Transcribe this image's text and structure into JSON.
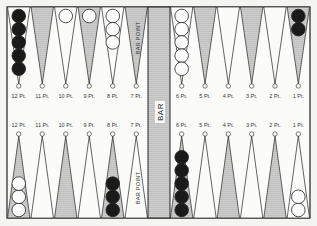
{
  "board": {
    "bar_label": "BAR",
    "bar_point_label": "BAR POINT",
    "top_labels": [
      "12 Pt.",
      "11 Pt.",
      "10 Pt.",
      "9 Pt.",
      "8 Pt.",
      "7 Pt.",
      "6 Pt.",
      "5 Pt.",
      "4 Pt.",
      "3 Pt.",
      "2 Pt.",
      "1 Pt."
    ],
    "bottom_labels": [
      "12 Pt.",
      "11 Pt.",
      "10 Pt.",
      "9 Pt.",
      "8 Pt.",
      "7 Pt.",
      "6 Pt.",
      "5 Pt.",
      "4 Pt.",
      "3 Pt.",
      "2 Pt.",
      "1 Pt."
    ],
    "colors": {
      "background": "#f4f4f2",
      "line": "#222222",
      "black_checker": "#1a1a1a",
      "white_checker": "#ffffff"
    },
    "top_points": [
      {
        "label": "12 Pt.",
        "shaded": false,
        "checkers": {
          "color": "black",
          "count": 5
        }
      },
      {
        "label": "11 Pt.",
        "shaded": true,
        "checkers": {
          "color": "none",
          "count": 0
        }
      },
      {
        "label": "10 Pt.",
        "shaded": false,
        "checkers": {
          "color": "white",
          "count": 1
        }
      },
      {
        "label": "9 Pt.",
        "shaded": true,
        "checkers": {
          "color": "white",
          "count": 1
        }
      },
      {
        "label": "8 Pt.",
        "shaded": false,
        "checkers": {
          "color": "white",
          "count": 3
        }
      },
      {
        "label": "7 Pt.",
        "shaded": true,
        "checkers": {
          "color": "none",
          "count": 0
        }
      },
      {
        "label": "6 Pt.",
        "shaded": false,
        "checkers": {
          "color": "white",
          "count": 5
        }
      },
      {
        "label": "5 Pt.",
        "shaded": true,
        "checkers": {
          "color": "none",
          "count": 0
        }
      },
      {
        "label": "4 Pt.",
        "shaded": false,
        "checkers": {
          "color": "none",
          "count": 0
        }
      },
      {
        "label": "3 Pt.",
        "shaded": true,
        "checkers": {
          "color": "none",
          "count": 0
        }
      },
      {
        "label": "2 Pt.",
        "shaded": false,
        "checkers": {
          "color": "none",
          "count": 0
        }
      },
      {
        "label": "1 Pt.",
        "shaded": true,
        "checkers": {
          "color": "black",
          "count": 2
        }
      }
    ],
    "bottom_points": [
      {
        "label": "12 Pt.",
        "shaded": true,
        "checkers": {
          "color": "white",
          "count": 3
        }
      },
      {
        "label": "11 Pt.",
        "shaded": false,
        "checkers": {
          "color": "none",
          "count": 0
        }
      },
      {
        "label": "10 Pt.",
        "shaded": true,
        "checkers": {
          "color": "none",
          "count": 0
        }
      },
      {
        "label": "9 Pt.",
        "shaded": false,
        "checkers": {
          "color": "none",
          "count": 0
        }
      },
      {
        "label": "8 Pt.",
        "shaded": true,
        "checkers": {
          "color": "black",
          "count": 3
        }
      },
      {
        "label": "7 Pt.",
        "shaded": false,
        "checkers": {
          "color": "none",
          "count": 0
        }
      },
      {
        "label": "6 Pt.",
        "shaded": true,
        "checkers": {
          "color": "black",
          "count": 5
        }
      },
      {
        "label": "5 Pt.",
        "shaded": false,
        "checkers": {
          "color": "none",
          "count": 0
        }
      },
      {
        "label": "4 Pt.",
        "shaded": true,
        "checkers": {
          "color": "none",
          "count": 0
        }
      },
      {
        "label": "3 Pt.",
        "shaded": false,
        "checkers": {
          "color": "none",
          "count": 0
        }
      },
      {
        "label": "2 Pt.",
        "shaded": true,
        "checkers": {
          "color": "none",
          "count": 0
        }
      },
      {
        "label": "1 Pt.",
        "shaded": false,
        "checkers": {
          "color": "white",
          "count": 2
        }
      }
    ]
  }
}
